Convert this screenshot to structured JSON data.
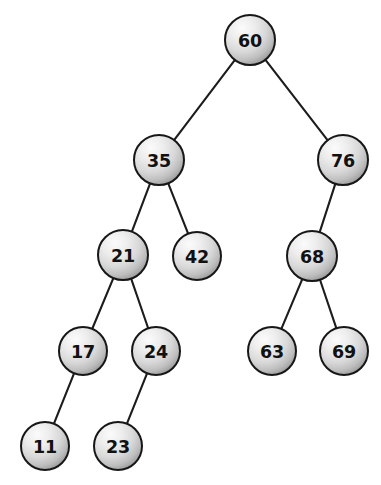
{
  "figure": {
    "type": "binary-search-tree",
    "background_color": "#ffffff",
    "node_fill_light": "#f2f2f2",
    "node_fill_mid": "#d6d6d6",
    "node_fill_dark": "#9a9a9a",
    "node_stroke_color": "#171717",
    "edge_color": "#1c1c1c",
    "label_color": "#111111",
    "node_radius": 25,
    "width": 381,
    "height": 485
  },
  "nodes": [
    {
      "id": "n60",
      "label": "60",
      "value": 60,
      "cx": 250,
      "cy": 40,
      "r": 25,
      "depth": 0,
      "role": "root"
    },
    {
      "id": "n35",
      "label": "35",
      "value": 35,
      "cx": 159,
      "cy": 160,
      "r": 25,
      "depth": 1,
      "role": "internal"
    },
    {
      "id": "n76",
      "label": "76",
      "value": 76,
      "cx": 343,
      "cy": 160,
      "r": 25,
      "depth": 1,
      "role": "internal"
    },
    {
      "id": "n21",
      "label": "21",
      "value": 21,
      "cx": 123,
      "cy": 255,
      "r": 25,
      "depth": 2,
      "role": "internal"
    },
    {
      "id": "n42",
      "label": "42",
      "value": 42,
      "cx": 197,
      "cy": 256,
      "r": 24,
      "depth": 2,
      "role": "leaf"
    },
    {
      "id": "n68",
      "label": "68",
      "value": 68,
      "cx": 312,
      "cy": 256,
      "r": 25,
      "depth": 2,
      "role": "internal"
    },
    {
      "id": "n17",
      "label": "17",
      "value": 17,
      "cx": 83,
      "cy": 351,
      "r": 24,
      "depth": 3,
      "role": "internal"
    },
    {
      "id": "n24",
      "label": "24",
      "value": 24,
      "cx": 156,
      "cy": 351,
      "r": 24,
      "depth": 3,
      "role": "internal"
    },
    {
      "id": "n63",
      "label": "63",
      "value": 63,
      "cx": 272,
      "cy": 351,
      "r": 24,
      "depth": 3,
      "role": "leaf"
    },
    {
      "id": "n69",
      "label": "69",
      "value": 69,
      "cx": 344,
      "cy": 351,
      "r": 24,
      "depth": 3,
      "role": "leaf"
    },
    {
      "id": "n11",
      "label": "11",
      "value": 11,
      "cx": 45,
      "cy": 446,
      "r": 24,
      "depth": 4,
      "role": "leaf"
    },
    {
      "id": "n23",
      "label": "23",
      "value": 23,
      "cx": 118,
      "cy": 446,
      "r": 24,
      "depth": 4,
      "role": "leaf"
    }
  ],
  "edges": [
    {
      "id": "e60-35",
      "from": "n60",
      "to": "n35",
      "side": "left",
      "x1": 234,
      "y1": 59,
      "x2": 173,
      "y2": 140
    },
    {
      "id": "e60-76",
      "from": "n60",
      "to": "n76",
      "side": "right",
      "x1": 268,
      "y1": 57,
      "x2": 333,
      "y2": 138
    },
    {
      "id": "e35-21",
      "from": "n35",
      "to": "n21",
      "side": "left",
      "x1": 146,
      "y1": 181,
      "x2": 132,
      "y2": 232
    },
    {
      "id": "e35-42",
      "from": "n35",
      "to": "n42",
      "side": "right",
      "x1": 174,
      "y1": 180,
      "x2": 192,
      "y2": 233
    },
    {
      "id": "e76-68",
      "from": "n76",
      "to": "n68",
      "side": "left",
      "x1": 331,
      "y1": 182,
      "x2": 318,
      "y2": 232
    },
    {
      "id": "e21-17",
      "from": "n21",
      "to": "n17",
      "side": "left",
      "x1": 109,
      "y1": 276,
      "x2": 93,
      "y2": 329
    },
    {
      "id": "e21-24",
      "from": "n21",
      "to": "n24",
      "side": "right",
      "x1": 136,
      "y1": 276,
      "x2": 150,
      "y2": 328
    },
    {
      "id": "e68-63",
      "from": "n68",
      "to": "n63",
      "side": "left",
      "x1": 300,
      "y1": 278,
      "x2": 280,
      "y2": 329
    },
    {
      "id": "e68-69",
      "from": "n68",
      "to": "n69",
      "side": "right",
      "x1": 323,
      "y1": 278,
      "x2": 340,
      "y2": 328
    },
    {
      "id": "e17-11",
      "from": "n17",
      "to": "n11",
      "side": "left",
      "x1": 70,
      "y1": 371,
      "x2": 53,
      "y2": 424
    },
    {
      "id": "e24-23",
      "from": "n24",
      "to": "n23",
      "side": "left",
      "x1": 143,
      "y1": 370,
      "x2": 125,
      "y2": 424
    }
  ]
}
